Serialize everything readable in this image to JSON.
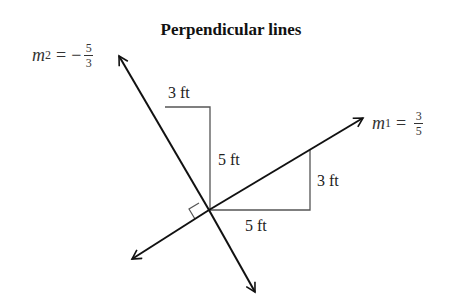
{
  "title": "Perpendicular lines",
  "lines": {
    "m1": {
      "label_var": "m",
      "label_sub": "1",
      "eq": "=",
      "sign": "",
      "num": "3",
      "den": "5"
    },
    "m2": {
      "label_var": "m",
      "label_sub": "2",
      "eq": "=",
      "sign": "−",
      "num": "5",
      "den": "3"
    }
  },
  "triangles": {
    "upper": {
      "run": "3 ft",
      "rise": "5 ft"
    },
    "lower": {
      "run": "5 ft",
      "rise": "3 ft"
    }
  },
  "colors": {
    "line": "#111111",
    "triangle": "#555555"
  }
}
